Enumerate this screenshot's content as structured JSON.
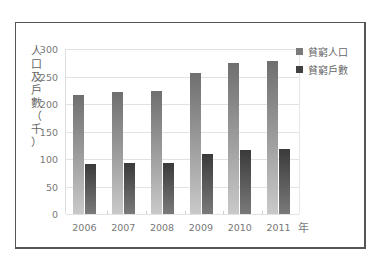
{
  "chart_data": {
    "type": "bar",
    "title": "",
    "xlabel": "年",
    "ylabel": "人口及戶數（千）",
    "categories": [
      "2006",
      "2007",
      "2008",
      "2009",
      "2010",
      "2011"
    ],
    "series": [
      {
        "name": "貧窮人口",
        "values": [
          216,
          222,
          224,
          257,
          275,
          278
        ],
        "color": "#7a7a7a"
      },
      {
        "name": "貧窮戶數",
        "values": [
          91,
          93,
          93,
          109,
          116,
          118
        ],
        "color": "#404040"
      }
    ],
    "ylim": [
      0,
      300
    ],
    "yticks": [
      "0",
      "50",
      "100",
      "150",
      "200",
      "250",
      "300"
    ],
    "grid": true,
    "legend_position": "right-top"
  },
  "labels": {
    "ylabel_chars": [
      "人",
      "口",
      "及",
      "戶",
      "數",
      "（",
      "千",
      "）"
    ],
    "x_suffix": "年"
  }
}
